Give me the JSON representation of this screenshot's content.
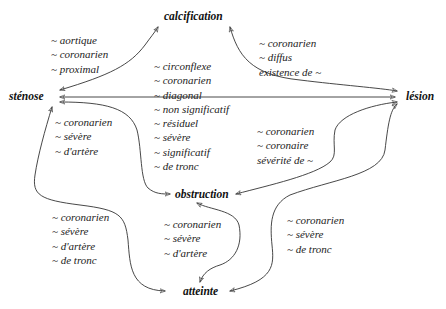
{
  "diagram": {
    "type": "concept-graph",
    "nodes": [
      {
        "id": "calcification",
        "label": "calcification"
      },
      {
        "id": "stenose",
        "label": "sténose"
      },
      {
        "id": "lesion",
        "label": "lésion"
      },
      {
        "id": "obstruction",
        "label": "obstruction"
      },
      {
        "id": "atteinte",
        "label": "atteinte"
      }
    ],
    "edge_labels": {
      "stenose_calcification": [
        "~ aortique",
        "~ coronarien",
        "~ proximal"
      ],
      "lesion_calcification": [
        "~ coronarien",
        "~ diffus",
        "existence de ~"
      ],
      "lesion_stenose": [
        "~ circonflexe",
        "~ coronarien",
        "~ diagonal",
        "~ non significatif",
        "~ résiduel",
        "~ sévère",
        "~ significatif",
        "~ de tronc"
      ],
      "stenose_obstruction": [
        "~ coronarien",
        "~ sévère",
        "~ d'artère"
      ],
      "lesion_obstruction": [
        "~ coronarien",
        "~ coronaire",
        "sévérité de ~"
      ],
      "stenose_atteinte": [
        "~ coronarien",
        "~ sévère",
        "~ d'artère",
        "~ de tronc"
      ],
      "obstruction_atteinte": [
        "~ coronarien",
        "~ sévère",
        "~ d'artère"
      ],
      "lesion_atteinte": [
        "~ coronarien",
        "~ sévère",
        "~ de tronc"
      ]
    },
    "edges": [
      {
        "from": "stenose",
        "to": "calcification",
        "bidirectional": true
      },
      {
        "from": "lesion",
        "to": "calcification",
        "bidirectional": true
      },
      {
        "from": "lesion",
        "to": "stenose",
        "bidirectional": true
      },
      {
        "from": "stenose",
        "to": "lesion",
        "bidirectional": true
      },
      {
        "from": "stenose",
        "to": "obstruction",
        "bidirectional": true
      },
      {
        "from": "lesion",
        "to": "obstruction",
        "bidirectional": true
      },
      {
        "from": "stenose",
        "to": "atteinte",
        "bidirectional": true
      },
      {
        "from": "obstruction",
        "to": "atteinte",
        "bidirectional": true
      },
      {
        "from": "lesion",
        "to": "atteinte",
        "bidirectional": true
      }
    ],
    "colors": {
      "line": "#333333",
      "text": "#1a1a1a",
      "background": "#ffffff"
    }
  }
}
